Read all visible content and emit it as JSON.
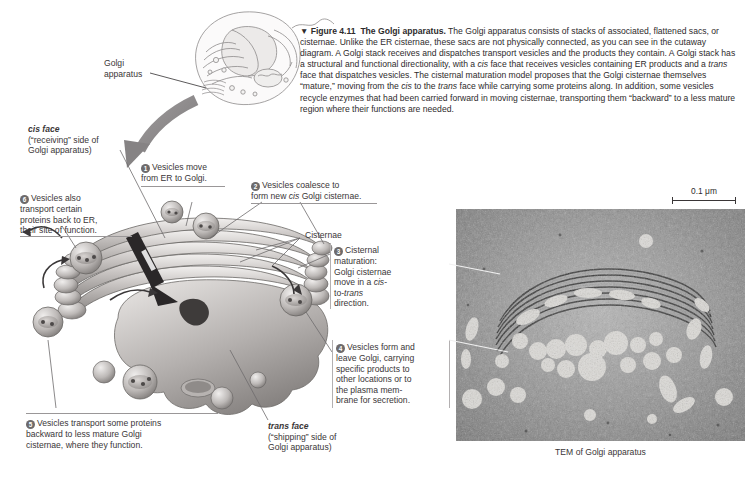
{
  "figure": {
    "marker": "▼",
    "number": "Figure 4.11",
    "title": "The Golgi apparatus.",
    "caption": "The Golgi apparatus consists of stacks of associated, flattened sacs, or cisternae. Unlike the ER cisternae, these sacs are not physically connected, as you can see in the cutaway diagram. A Golgi stack receives and dispatches transport vesicles and the products they contain. A Golgi stack has a structural and functional directionality, with a cis face that receives vesicles containing ER products and a trans face that dispatches vesicles. The cisternal maturation model proposes that the Golgi cisternae themselves “mature,” moving from the cis to the trans face while carrying some proteins along. In addition, some vesicles recycle enzymes that had been carried forward in moving cisternae, transporting them “backward” to a less mature region where their functions are needed."
  },
  "cell_callout": {
    "label_line1": "Golgi",
    "label_line2": "apparatus"
  },
  "faces": {
    "cis": {
      "name": "cis face",
      "detail_line1": "(“receiving” side of",
      "detail_line2": "Golgi apparatus)"
    },
    "trans": {
      "name": "trans face",
      "detail_line1": "(“shipping” side of",
      "detail_line2": "Golgi apparatus)"
    }
  },
  "cisternae_label": "Cisternae",
  "steps": [
    {
      "number": "1",
      "lines": [
        "Vesicles move",
        "from ER to Golgi."
      ]
    },
    {
      "number": "2",
      "lines": [
        "Vesicles coalesce to",
        "form new cis Golgi cisternae."
      ]
    },
    {
      "number": "3",
      "lines": [
        "Cisternal",
        "maturation:",
        "Golgi cisternae",
        "move in a cis-",
        "to-trans",
        "direction."
      ]
    },
    {
      "number": "4",
      "lines": [
        "Vesicles form and",
        "leave Golgi, carrying",
        "specific products to",
        "other locations or to",
        "the plasma mem-",
        "brane for secretion."
      ]
    },
    {
      "number": "5",
      "lines": [
        "Vesicles transport some proteins",
        "backward to less mature Golgi",
        "cisternae, where they function."
      ]
    },
    {
      "number": "6",
      "lines": [
        "Vesicles also",
        "transport certain",
        "proteins back to ER,",
        "their site of function."
      ]
    }
  ],
  "micrograph": {
    "caption": "TEM of Golgi apparatus",
    "scale_bar_label": "0.1 μm"
  },
  "colors": {
    "text": "#2e2b2c",
    "muted_text": "#5d5a5b",
    "bullet": "#6d6a6b",
    "leader": "#6f6c6d",
    "arrow": "#8a8788",
    "micrograph_bg": "#8d8d8d"
  }
}
